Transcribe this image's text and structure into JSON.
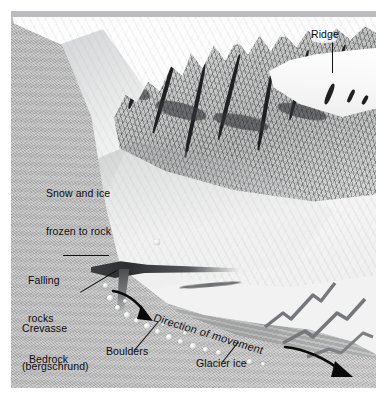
{
  "figure": {
    "kind": "glacier-cross-section-illustration",
    "width": 380,
    "height": 401,
    "background_color": "#ffffff"
  },
  "palette": {
    "sky": "#c2c4c6",
    "snow": "#fafafa",
    "rock": "#9c9d9d",
    "bedrock": "#b6b7b6",
    "glacier_ice": "#b0b1b1",
    "shadow": "#2c2e30",
    "label_text": "#0d0d0d",
    "leader_line": "#111213"
  },
  "labels": [
    {
      "id": "ridge",
      "text": "Ridge",
      "style": "regular"
    },
    {
      "id": "snow_ice",
      "line1": "Snow and ice",
      "line2": "frozen to rock",
      "style": "regular"
    },
    {
      "id": "falling",
      "line1": "Falling",
      "line2": "rocks",
      "style": "regular"
    },
    {
      "id": "crevasse",
      "line1": "Crevasse",
      "line2": "(bergschrund)",
      "style": "line2-italic"
    },
    {
      "id": "bedrock",
      "text": "Bedrock",
      "style": "regular"
    },
    {
      "id": "boulders",
      "text": "Boulders",
      "style": "regular"
    },
    {
      "id": "glacier_ice",
      "text": "Glacier ice",
      "style": "regular"
    },
    {
      "id": "direction",
      "text": "Direction of movement",
      "style": "rotated-in-scene"
    }
  ],
  "annotations": {
    "leader_lines": 5,
    "movement_arrows": 2,
    "arrow_color": "#0a0a0a"
  }
}
